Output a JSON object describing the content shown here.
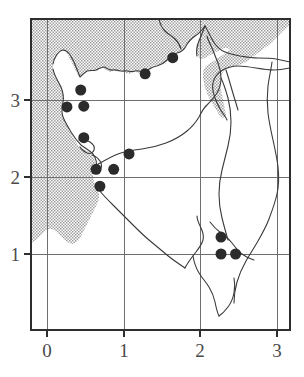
{
  "figure": {
    "type": "distribution-map"
  },
  "chart_data": {
    "type": "scatter",
    "title": "",
    "xlabel": "",
    "ylabel": "",
    "xlim": [
      -0.25,
      3.18
    ],
    "ylim": [
      0.1,
      3.88
    ],
    "grid": true,
    "legend": "none",
    "axis": {
      "x_ticks": [
        0,
        1,
        2,
        3
      ],
      "y_ticks": [
        1,
        2,
        3
      ],
      "x_tick_labels": [
        "0",
        "1",
        "2",
        "3"
      ],
      "y_tick_labels": [
        "1",
        "2",
        "3"
      ]
    },
    "series": [
      {
        "name": "sample sites",
        "marker": "filled-circle",
        "color": "#2b2b2b",
        "marker_size_px": 11,
        "points": [
          {
            "x": 1.64,
            "y": 3.55
          },
          {
            "x": 1.28,
            "y": 3.34
          },
          {
            "x": 0.44,
            "y": 3.13
          },
          {
            "x": 0.26,
            "y": 2.91
          },
          {
            "x": 0.48,
            "y": 2.92
          },
          {
            "x": 0.48,
            "y": 2.51
          },
          {
            "x": 1.07,
            "y": 2.3
          },
          {
            "x": 0.64,
            "y": 2.1
          },
          {
            "x": 0.87,
            "y": 2.1
          },
          {
            "x": 0.69,
            "y": 1.88
          },
          {
            "x": 2.27,
            "y": 1.22
          },
          {
            "x": 2.27,
            "y": 1.0
          },
          {
            "x": 2.46,
            "y": 1.0
          }
        ]
      }
    ]
  },
  "map": {
    "sea_fill_label": "stippled-grey",
    "sea_color": "#bdbdbd",
    "coast_color": "#3d3d3d",
    "frame_color": "#2e2e2e",
    "grid_color": "#707070",
    "background": "#ffffff"
  },
  "axis_labels": {
    "x": [
      {
        "value": "0",
        "px": 47
      },
      {
        "value": "1",
        "px": 124
      },
      {
        "value": "2",
        "px": 200
      },
      {
        "value": "3",
        "px": 277
      }
    ],
    "y": [
      {
        "value": "3",
        "px": 100
      },
      {
        "value": "2",
        "px": 177
      },
      {
        "value": "1",
        "px": 254
      }
    ]
  }
}
